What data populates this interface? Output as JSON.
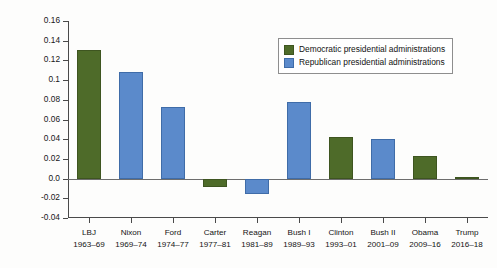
{
  "chart_data": {
    "type": "bar",
    "title": "",
    "xlabel": "",
    "ylabel": "Average annual percent change in billions of 2009 constant dollars",
    "ylim": [
      -0.04,
      0.16
    ],
    "ytick_labels": [
      "0.16",
      "0.14",
      "0.12",
      "0.1",
      "0.08",
      "0.06",
      "0.04",
      "0.02",
      "0.0",
      "-0.02",
      "-0.04"
    ],
    "ytick_values": [
      0.16,
      0.14,
      0.12,
      0.1,
      0.08,
      0.06,
      0.04,
      0.02,
      0.0,
      -0.02,
      -0.04
    ],
    "grid": false,
    "legend_position": "upper-right",
    "categories": [
      "LBJ 1963-69",
      "Nixon 1969-74",
      "Ford 1974-77",
      "Carter 1977-81",
      "Reagan 1981-89",
      "Bush I 1989-93",
      "Clinton 1993-01",
      "Bush II 2001-09",
      "Obama 2009-16",
      "Trump 2016-18"
    ],
    "values": [
      0.131,
      0.108,
      0.073,
      -0.009,
      -0.016,
      0.078,
      0.042,
      0.04,
      0.023,
      0.002
    ],
    "series": [
      {
        "name": "Democratic presidential administrations",
        "color": "#4e6b29",
        "values": [
          0.131,
          null,
          null,
          -0.009,
          null,
          null,
          0.042,
          null,
          0.023,
          0.002
        ]
      },
      {
        "name": "Republican presidential administrations",
        "color": "#5b8acb",
        "values": [
          null,
          0.108,
          0.073,
          null,
          -0.016,
          0.078,
          null,
          0.04,
          null,
          null
        ]
      }
    ],
    "bars": [
      {
        "name": "LBJ",
        "years": "1963–69",
        "value": 0.131,
        "party": "dem"
      },
      {
        "name": "Nixon",
        "years": "1969–74",
        "value": 0.108,
        "party": "rep"
      },
      {
        "name": "Ford",
        "years": "1974–77",
        "value": 0.073,
        "party": "rep"
      },
      {
        "name": "Carter",
        "years": "1977–81",
        "value": -0.009,
        "party": "dem"
      },
      {
        "name": "Reagan",
        "years": "1981–89",
        "value": -0.016,
        "party": "rep"
      },
      {
        "name": "Bush I",
        "years": "1989–93",
        "value": 0.078,
        "party": "rep"
      },
      {
        "name": "Clinton",
        "years": "1993–01",
        "value": 0.042,
        "party": "dem"
      },
      {
        "name": "Bush II",
        "years": "2001–09",
        "value": 0.04,
        "party": "rep"
      },
      {
        "name": "Obama",
        "years": "2009–16",
        "value": 0.023,
        "party": "dem"
      },
      {
        "name": "Trump",
        "years": "2016–18",
        "value": 0.002,
        "party": "dem"
      }
    ]
  },
  "legend": {
    "items": [
      {
        "label": "Democratic presidential administrations",
        "party": "dem",
        "color": "#4e6b29"
      },
      {
        "label": "Republican presidential administrations",
        "party": "rep",
        "color": "#5b8acb"
      }
    ]
  },
  "axis": {
    "y_title": "Average annual percent change in billions of 2009 constant dollars"
  }
}
